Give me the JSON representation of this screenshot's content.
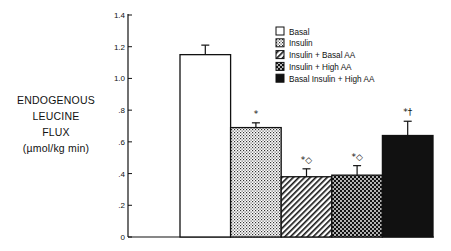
{
  "chart_data": {
    "type": "bar",
    "title": "",
    "xlabel": "",
    "ylabel": "ENDOGENOUS LEUCINE FLUX (µmol/kg min)",
    "ylabel_lines": [
      "ENDOGENOUS",
      "LEUCINE",
      "FLUX",
      "(µmol/kg  min)"
    ],
    "ylim": [
      0,
      1.4
    ],
    "yticks": [
      0,
      0.2,
      0.4,
      0.6,
      0.8,
      1.0,
      1.2,
      1.4
    ],
    "ytick_labels": [
      "0",
      ".2",
      ".4",
      ".6",
      ".8",
      "1.0",
      "1.2",
      "1.4"
    ],
    "grid": false,
    "legend_position": "upper right",
    "categories": [
      "Basal",
      "Insulin",
      "Insulin + Basal AA",
      "Insulin + High AA",
      "Basal Insulin + High AA"
    ],
    "values": [
      1.15,
      0.69,
      0.38,
      0.39,
      0.64
    ],
    "error_upper": [
      1.21,
      0.72,
      0.43,
      0.45,
      0.73
    ],
    "annotations": [
      "",
      "*",
      "*◇",
      "*◇",
      "*†"
    ],
    "patterns": [
      "white",
      "dotted",
      "diagonal-hatch",
      "checkerboard",
      "solid-black"
    ]
  },
  "legend": {
    "items": [
      {
        "label": "Basal",
        "pattern": "white"
      },
      {
        "label": "Insulin",
        "pattern": "dotted"
      },
      {
        "label": "Insulin  +  Basal  AA",
        "pattern": "diagonal-hatch"
      },
      {
        "label": "Insulin  +  High  AA",
        "pattern": "checkerboard"
      },
      {
        "label": "Basal  Insulin  +  High  AA",
        "pattern": "solid-black"
      }
    ]
  },
  "colors": {
    "ink": "#111111",
    "background": "#ffffff"
  }
}
